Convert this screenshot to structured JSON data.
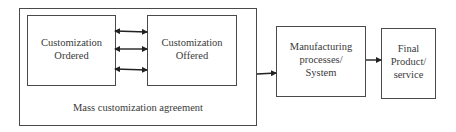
{
  "diagram": {
    "outer_box": {
      "label": "Mass customization agreement"
    },
    "customization_ordered": {
      "line1": "Customization",
      "line2": "Ordered"
    },
    "customization_offered": {
      "line1": "Customization",
      "line2": "Offered"
    },
    "manufacturing": {
      "line1": "Manufacturing",
      "line2": "processes/",
      "line3": "System"
    },
    "final_product": {
      "line1": "Final",
      "line2": "Product/",
      "line3": "service"
    },
    "bidirectional_arrow_count": 3,
    "colors": {
      "stroke": "#4a4a4a",
      "arrow": "#222222",
      "text": "#3a3a3a"
    }
  }
}
